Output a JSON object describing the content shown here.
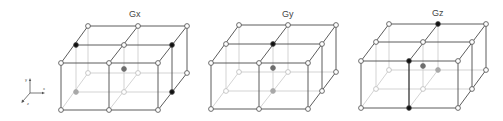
{
  "axes_legend": {
    "x_label": "x",
    "y_label": "y",
    "z_label": "z"
  },
  "colors": {
    "front_line": "#4a4a4a",
    "hidden_line": "#c8c8c8",
    "node_open_fill": "#ffffff",
    "node_black": "#111111",
    "node_dark_grey": "#6e6e6e",
    "node_light_grey": "#a8a8a8"
  },
  "grids": [
    {
      "title": "Gx",
      "highlighted_nodes": [
        {
          "position": "top-left-middle-depth",
          "shade": "black"
        },
        {
          "position": "top-right-middle-depth",
          "shade": "black"
        },
        {
          "position": "bottom-right-middle-depth",
          "shade": "black"
        },
        {
          "position": "center",
          "shade": "dark-grey"
        },
        {
          "position": "bottom-left-middle-depth",
          "shade": "light-grey"
        }
      ]
    },
    {
      "title": "Gy",
      "highlighted_nodes": [
        {
          "position": "top-center-middle-depth",
          "shade": "black"
        },
        {
          "position": "center",
          "shade": "dark-grey"
        },
        {
          "position": "bottom-center-middle-depth",
          "shade": "light-grey"
        }
      ]
    },
    {
      "title": "Gz",
      "highlighted_nodes": [
        {
          "position": "top-center-back",
          "shade": "black"
        },
        {
          "position": "top-center-front",
          "shade": "black"
        },
        {
          "position": "bottom-center-front",
          "shade": "black"
        },
        {
          "position": "center",
          "shade": "dark-grey"
        },
        {
          "position": "middle-center-back",
          "shade": "light-grey"
        }
      ]
    }
  ]
}
